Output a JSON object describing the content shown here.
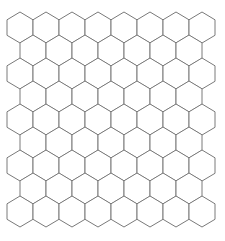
{
  "diagram": {
    "type": "hexagon-grid",
    "orientation": "pointy-top",
    "rows": 9,
    "even_row_count": 8,
    "odd_row_count": 7,
    "hex_width": 26,
    "hex_height": 31,
    "row_spacing": 23,
    "origin_x": 7,
    "origin_y": 12,
    "stroke_color": "#7a7a7a",
    "fill_color": "#ffffff",
    "background_color": "#ffffff"
  }
}
